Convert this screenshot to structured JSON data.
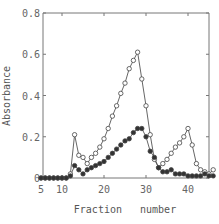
{
  "chart_data": {
    "type": "line",
    "title": "",
    "xlabel": "Fraction number",
    "ylabel": "Absorbance",
    "xlim": [
      5,
      46
    ],
    "ylim": [
      0,
      0.8
    ],
    "x_ticks": [
      5,
      10,
      20,
      30,
      40
    ],
    "y_ticks": [
      0,
      0.2,
      0.4,
      0.6,
      0.8
    ],
    "y_tick_labels": [
      "0",
      "0.2",
      "0.4",
      "0.6",
      "0.8"
    ],
    "grid": false,
    "legend": "none",
    "series": [
      {
        "name": "open circles",
        "marker": "open-circle",
        "x": [
          5,
          6,
          7,
          8,
          9,
          10,
          11,
          12,
          13,
          14,
          15,
          16,
          17,
          18,
          19,
          20,
          21,
          22,
          23,
          24,
          25,
          26,
          27,
          28,
          29,
          30,
          31,
          32,
          33,
          34,
          35,
          36,
          37,
          38,
          39,
          40,
          41,
          42,
          43,
          44,
          45,
          46
        ],
        "values": [
          0,
          0,
          0,
          0,
          0,
          0,
          0,
          0.02,
          0.21,
          0.11,
          0.1,
          0.07,
          0.1,
          0.12,
          0.15,
          0.19,
          0.24,
          0.3,
          0.35,
          0.41,
          0.46,
          0.53,
          0.57,
          0.61,
          0.48,
          0.35,
          0.21,
          0.09,
          0.05,
          0.07,
          0.09,
          0.12,
          0.15,
          0.17,
          0.2,
          0.24,
          0.16,
          0.07,
          0.04,
          0.03,
          0.02,
          0.04
        ]
      },
      {
        "name": "filled circles",
        "marker": "filled-circle",
        "x": [
          5,
          6,
          7,
          8,
          9,
          10,
          11,
          12,
          13,
          14,
          15,
          16,
          17,
          18,
          19,
          20,
          21,
          22,
          23,
          24,
          25,
          26,
          27,
          28,
          29,
          30,
          31,
          32,
          33,
          34,
          35,
          36,
          37,
          38,
          39,
          40,
          41,
          42,
          43,
          44,
          45,
          46
        ],
        "values": [
          0,
          0,
          0,
          0,
          0,
          0,
          0,
          0.01,
          0.06,
          0.04,
          0.02,
          0.04,
          0.05,
          0.06,
          0.07,
          0.08,
          0.1,
          0.12,
          0.14,
          0.16,
          0.18,
          0.19,
          0.22,
          0.24,
          0.24,
          0.2,
          0.13,
          0.1,
          0.05,
          0.03,
          0.03,
          0.04,
          0.02,
          0.02,
          0.02,
          0.01,
          0.01,
          0.01,
          0.01,
          0.02,
          0.01,
          0.01
        ]
      }
    ]
  },
  "axes": {
    "xlabel": "Fraction   number",
    "ylabel": "Absorbance"
  }
}
